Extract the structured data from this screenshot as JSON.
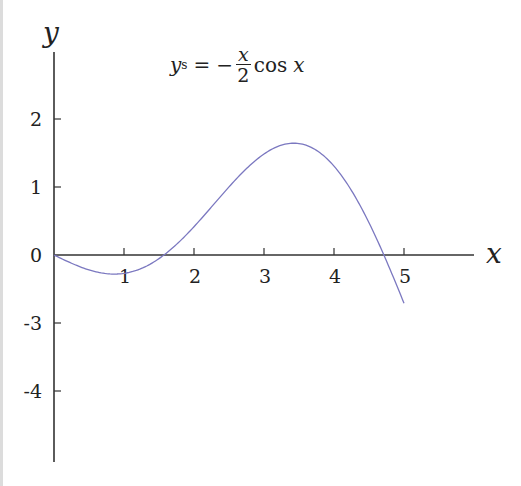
{
  "chart_data": {
    "type": "line",
    "formula": {
      "lhs": "y",
      "lhs_sub": "s",
      "equals": "=",
      "minus": "−",
      "num": "x",
      "den": "2",
      "func": "cos",
      "arg": "x"
    },
    "xlabel": "x",
    "ylabel": "y",
    "xlim": [
      0,
      6
    ],
    "ylim": [
      -2.9,
      3.0
    ],
    "x_ticks": [
      1,
      2,
      3,
      4,
      5
    ],
    "x_tick_labels": [
      "1",
      "2",
      "3",
      "4",
      "5"
    ],
    "y_ticks": [
      2,
      1,
      0,
      -1,
      -2
    ],
    "y_tick_labels": [
      "2",
      "1",
      "0",
      "-3",
      "-4"
    ],
    "grid": false,
    "series": [
      {
        "name": "y_s",
        "color": "#7b78c0",
        "x": [
          0,
          0.5,
          0.86,
          1,
          1.5,
          1.571,
          2,
          2.5,
          3,
          3.43,
          3.8,
          4,
          4.5,
          4.712,
          5
        ],
        "y": [
          0,
          -0.22,
          -0.28,
          -0.27,
          -0.05,
          0,
          0.42,
          1.0,
          1.48,
          1.64,
          1.5,
          1.31,
          0.48,
          0,
          -0.71
        ]
      }
    ]
  }
}
